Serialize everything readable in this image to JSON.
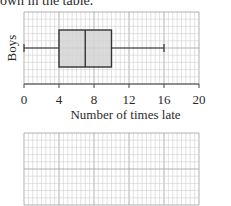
{
  "intro_text": "own in the table.",
  "chart_data": {
    "type": "boxplot",
    "title": "",
    "xlabel": "Number of times late",
    "ylabel": "Boys",
    "xlim": [
      0,
      20
    ],
    "x_ticks": [
      0,
      4,
      8,
      12,
      16,
      20
    ],
    "x_tick_labels": [
      "0",
      "4",
      "8",
      "12",
      "16",
      "20"
    ],
    "grid": true,
    "series": [
      {
        "name": "Boys",
        "min": 0,
        "q1": 4,
        "median": 7,
        "q3": 10,
        "max": 16
      }
    ],
    "box_fill": "#d3d3d3",
    "line_color": "#333333",
    "grid_color": "#cfcfcf",
    "major_grid_color": "#a8a8a8"
  },
  "blank_grid": {
    "description": "empty grid for answer",
    "columns": 20,
    "rows": 10
  }
}
